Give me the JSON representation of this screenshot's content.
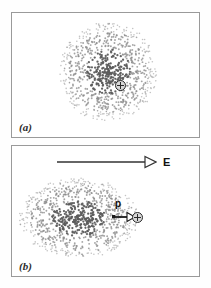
{
  "figure": {
    "panels": [
      {
        "id": "a",
        "label": "(a)",
        "caption_letter": "a",
        "cloud": {
          "shape": "circular",
          "center_x": 108,
          "center_y": 72,
          "radius_x": 50,
          "radius_y": 50,
          "dot_count": 900,
          "dot_color": "#8a8a8a",
          "dense_core_color": "#5c5c5c"
        },
        "nucleus": {
          "symbol": "+",
          "x": 108,
          "y": 72,
          "diameter": 11,
          "outline_color": "#2a2a2a",
          "fill_color": "#d8d8d8"
        }
      },
      {
        "id": "b",
        "label": "(b)",
        "caption_letter": "b",
        "cloud": {
          "shape": "elliptical",
          "center_x": 78,
          "center_y": 218,
          "radius_x": 60,
          "radius_y": 40,
          "dot_count": 950,
          "dot_color": "#8a8a8a",
          "dense_core_color": "#5c5c5c"
        },
        "nucleus": {
          "symbol": "+",
          "x": 137,
          "y": 217,
          "diameter": 11,
          "outline_color": "#2a2a2a",
          "fill_color": "#d8d8d8"
        },
        "field_arrow": {
          "label": "E",
          "x1": 57,
          "y1": 162,
          "x2": 157,
          "y2": 162,
          "head_style": "hollow-triangle",
          "color": "#333333"
        },
        "dipole_arrow": {
          "label": "p",
          "x1": 112,
          "y1": 217,
          "x2": 133,
          "y2": 217,
          "tail_marker": "square-dot",
          "head_style": "hollow-triangle",
          "color": "#1a1a1a"
        }
      }
    ],
    "colors": {
      "page_background": "#ffffff",
      "panel_background": "#ffffff",
      "panel_border": "#9a9a9a",
      "ink": "#111111",
      "dot": "#8a8a8a",
      "nucleus_fill": "#d8d8d8",
      "nucleus_outline": "#2a2a2a"
    }
  }
}
